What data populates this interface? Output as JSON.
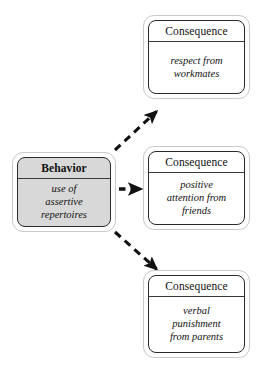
{
  "diagram": {
    "type": "behavior-consequence-flow",
    "background_color": "#ffffff",
    "behavior": {
      "title": "Behavior",
      "body": "use of\nassertive\nrepertoires",
      "body_lines": [
        "use of",
        "assertive",
        "repertoires"
      ],
      "fill_color": "#d8d8d8",
      "border_color": "#2a2a2a"
    },
    "consequences": [
      {
        "title": "Consequence",
        "body_lines": [
          "respect from",
          "workmates"
        ],
        "fill_color": "#ffffff",
        "border_color": "#2a2a2a"
      },
      {
        "title": "Consequence",
        "body_lines": [
          "positive",
          "attention from",
          "friends"
        ],
        "fill_color": "#ffffff",
        "border_color": "#2a2a2a"
      },
      {
        "title": "Consequence",
        "body_lines": [
          "verbal",
          "punishment",
          "from parents"
        ],
        "fill_color": "#ffffff",
        "border_color": "#2a2a2a"
      }
    ],
    "arrows": [
      {
        "name": "arrow-to-consequence-1",
        "style": "dashed",
        "direction": "up-right",
        "color": "#111111"
      },
      {
        "name": "arrow-to-consequence-2",
        "style": "dashed",
        "direction": "right",
        "color": "#111111"
      },
      {
        "name": "arrow-to-consequence-3",
        "style": "dashed",
        "direction": "down-right",
        "color": "#111111"
      }
    ]
  }
}
